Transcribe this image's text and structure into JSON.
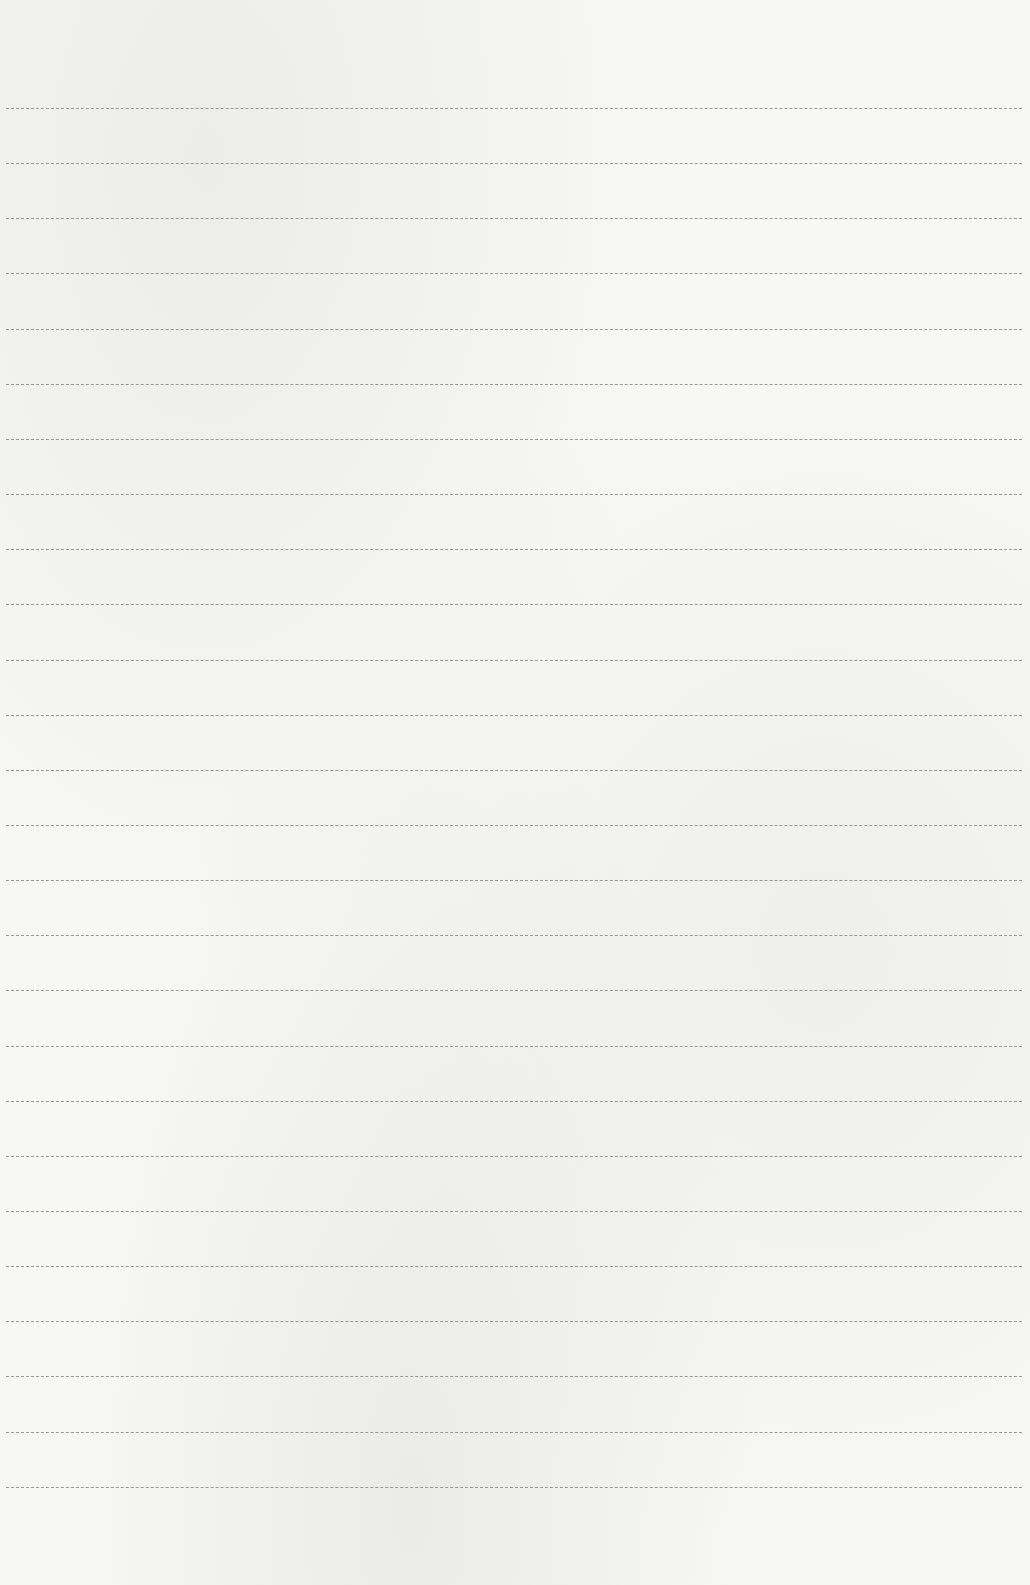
{
  "page": {
    "type": "blank lined paper",
    "background_color": "#f7f7f6",
    "rule_color": "#8a8a8a",
    "rule_count": 26,
    "first_rule_y": 108,
    "rule_spacing": 55.15,
    "rule_left": 6,
    "rule_width": 1016
  }
}
